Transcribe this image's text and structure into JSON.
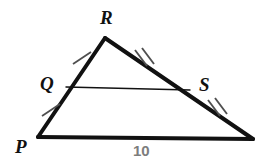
{
  "figure": {
    "type": "geometry-diagram",
    "background_color": "#ffffff",
    "stroke_color": "#111111",
    "tick_color": "#555555",
    "measure_color": "#7d7d7d"
  },
  "vertices": {
    "R": {
      "label": "R",
      "x": 105,
      "y": 38
    },
    "P": {
      "label": "P",
      "x": 38,
      "y": 137
    },
    "E": {
      "label": "",
      "x": 253,
      "y": 139
    },
    "Q": {
      "label": "Q",
      "x": 66,
      "y": 87
    },
    "S": {
      "label": "S",
      "x": 190,
      "y": 90
    }
  },
  "segments": [
    {
      "name": "side-PR",
      "from": "P",
      "to": "R",
      "width": 4
    },
    {
      "name": "side-RE",
      "from": "R",
      "to": "E",
      "width": 4
    },
    {
      "name": "side-PE",
      "from": "P",
      "to": "E",
      "width": 4
    },
    {
      "name": "midsegment-QS",
      "from": "Q",
      "to": "S",
      "width": 1.4
    }
  ],
  "tick_marks": [
    {
      "name": "tick-QR",
      "on": "side-PR",
      "count": 1,
      "x": 82,
      "y": 58
    },
    {
      "name": "tick-PQ",
      "on": "side-PR",
      "count": 1,
      "x": 51,
      "y": 110
    },
    {
      "name": "tick-RS",
      "on": "side-RE",
      "count": 2,
      "x": 143,
      "y": 58
    },
    {
      "name": "tick-SE",
      "on": "side-RE",
      "count": 2,
      "x": 216,
      "y": 108
    }
  ],
  "labels": {
    "R": "R",
    "Q": "Q",
    "S": "S",
    "P": "P",
    "base_measure": "10"
  }
}
